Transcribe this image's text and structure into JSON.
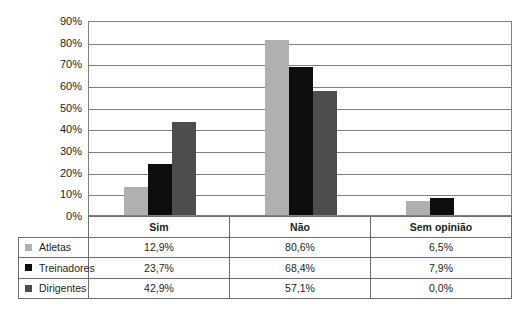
{
  "chart_data": {
    "type": "bar",
    "title": "",
    "subtitle": "",
    "xlabel": "",
    "ylabel": "",
    "categories": [
      "Sim",
      "Não",
      "Sem opinião"
    ],
    "series": [
      {
        "name": "Atletas",
        "color": "#b0b0b0",
        "values": [
          12.9,
          80.6,
          6.5
        ],
        "labels": [
          "12,9%",
          "80,6%",
          "6,5%"
        ]
      },
      {
        "name": "Treinadores",
        "color": "#0d0d0d",
        "values": [
          23.7,
          68.4,
          7.9
        ],
        "labels": [
          "23,7%",
          "68,4%",
          "7,9%"
        ]
      },
      {
        "name": "Dirigentes",
        "color": "#4d4d4d",
        "values": [
          42.9,
          57.1,
          0.0
        ],
        "labels": [
          "42,9%",
          "57,1%",
          "0,0%"
        ]
      }
    ],
    "ylim": [
      0,
      90
    ],
    "ytick_values": [
      0,
      10,
      20,
      30,
      40,
      50,
      60,
      70,
      80,
      90
    ],
    "ytick_labels": [
      "0%",
      "10%",
      "20%",
      "30%",
      "40%",
      "50%",
      "60%",
      "70%",
      "80%",
      "90%"
    ],
    "grid": true,
    "legend_position": "table-left",
    "value_suffix": "%"
  },
  "legend": {
    "items": [
      {
        "label": "Atletas",
        "swatch_color": "#b0b0b0"
      },
      {
        "label": "Treinadores",
        "swatch_color": "#0d0d0d"
      },
      {
        "label": "Dirigentes",
        "swatch_color": "#4d4d4d"
      }
    ]
  },
  "table": {
    "column_headers": [
      "Sim",
      "Não",
      "Sem opinião"
    ],
    "rows": [
      {
        "label": "Atletas",
        "cells": [
          "12,9%",
          "80,6%",
          "6,5%"
        ]
      },
      {
        "label": "Treinadores",
        "cells": [
          "23,7%",
          "68,4%",
          "7,9%"
        ]
      },
      {
        "label": "Dirigentes",
        "cells": [
          "42,9%",
          "57,1%",
          "0,0%"
        ]
      }
    ]
  },
  "colors": {
    "series_light": "#b0b0b0",
    "series_black": "#0d0d0d",
    "series_dark": "#4d4d4d",
    "grid": "#808080",
    "border": "#6e6e6e",
    "text": "#231f20"
  }
}
